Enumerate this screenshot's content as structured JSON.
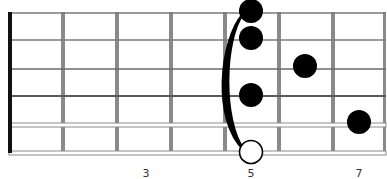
{
  "diagram": {
    "type": "guitar-chord-diagram",
    "orientation": "horizontal",
    "strings": 6,
    "frets_shown": 7,
    "fret_labels": [
      {
        "fret": 3,
        "label": "3"
      },
      {
        "fret": 5,
        "label": "5"
      },
      {
        "fret": 7,
        "label": "7"
      }
    ],
    "notes": [
      {
        "string": 1,
        "fret": 5,
        "style": "filled"
      },
      {
        "string": 2,
        "fret": 5,
        "style": "filled"
      },
      {
        "string": 3,
        "fret": 6,
        "style": "filled"
      },
      {
        "string": 4,
        "fret": 5,
        "style": "filled"
      },
      {
        "string": 5,
        "fret": 7,
        "style": "filled"
      },
      {
        "string": 6,
        "fret": 5,
        "style": "open-circle"
      }
    ],
    "barre": {
      "fret": 5,
      "from_string": 1,
      "to_string": 6
    },
    "colors": {
      "nut": "#111111",
      "fret": "#8a8a8a",
      "string": "#7a7a7a",
      "dot": "#000000",
      "open_dot_fill": "#ffffff"
    }
  }
}
